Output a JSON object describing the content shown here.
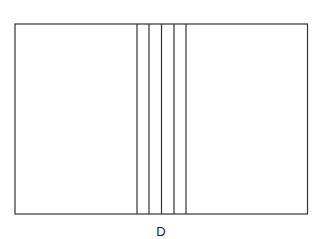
{
  "figure": {
    "label": "D",
    "stroke_color": "#333333",
    "background": "#ffffff",
    "outer_rect": {
      "x": 15,
      "y": 24,
      "width": 292.5,
      "height": 190
    },
    "vertical_lines_x": [
      137,
      149,
      161.5,
      174,
      186
    ]
  }
}
